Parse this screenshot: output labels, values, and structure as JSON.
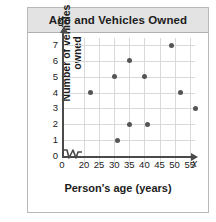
{
  "title": "Age and Vehicles Owned",
  "colors": {
    "header_background": "#e3e3e3",
    "point": "#555555",
    "grid": "#d9d9d9",
    "axis": "#4a4a4a",
    "text": "#1c1c1c",
    "figure_border": "#b8b8b8"
  },
  "chart_data": {
    "type": "scatter",
    "title": "Age and Vehicles Owned",
    "xlabel": "Person's age (years)",
    "ylabel": "Number of vehicles owned",
    "x_axis_name": "x",
    "y_axis_name": "y",
    "xticks": [
      0,
      20,
      25,
      30,
      35,
      40,
      45,
      50,
      55
    ],
    "yticks": [
      0,
      1,
      2,
      3,
      4,
      5,
      6,
      7
    ],
    "xlim": [
      18,
      59
    ],
    "ylim": [
      0,
      7.6
    ],
    "axis_break": true,
    "axis_break_label": "zigzag-break-between-0-and-20",
    "grid": true,
    "legend": "none",
    "points": [
      {
        "x": 22,
        "y": 4
      },
      {
        "x": 30,
        "y": 5
      },
      {
        "x": 31,
        "y": 1
      },
      {
        "x": 35,
        "y": 6
      },
      {
        "x": 35,
        "y": 2
      },
      {
        "x": 40,
        "y": 5
      },
      {
        "x": 41,
        "y": 2
      },
      {
        "x": 49,
        "y": 7
      },
      {
        "x": 52,
        "y": 4
      },
      {
        "x": 57,
        "y": 3
      }
    ]
  }
}
